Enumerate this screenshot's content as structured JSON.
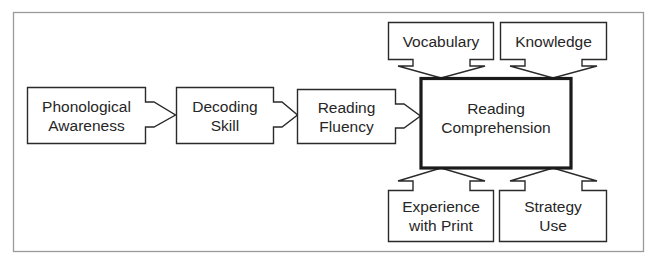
{
  "diagram": {
    "type": "flow-diagram",
    "colors": {
      "frame": "#9a9a9a",
      "stroke": "#2a2a2a",
      "text": "#262626",
      "background": "#ffffff"
    },
    "nodes": [
      {
        "id": "phonological",
        "lines": [
          "Phonological",
          "Awareness"
        ]
      },
      {
        "id": "decoding",
        "lines": [
          "Decoding",
          "Skill"
        ]
      },
      {
        "id": "fluency",
        "lines": [
          "Reading",
          "Fluency"
        ]
      },
      {
        "id": "comprehension",
        "lines": [
          "Reading",
          "Comprehension"
        ]
      },
      {
        "id": "vocabulary",
        "lines": [
          "Vocabulary"
        ]
      },
      {
        "id": "knowledge",
        "lines": [
          "Knowledge"
        ]
      },
      {
        "id": "experience",
        "lines": [
          "Experience",
          "with Print"
        ]
      },
      {
        "id": "strategy",
        "lines": [
          "Strategy",
          "Use"
        ]
      }
    ],
    "edges": [
      {
        "from": "Phonological Awareness",
        "to": "Decoding Skill"
      },
      {
        "from": "Decoding Skill",
        "to": "Reading Fluency"
      },
      {
        "from": "Reading Fluency",
        "to": "Reading Comprehension"
      },
      {
        "from": "Vocabulary",
        "to": "Reading Comprehension"
      },
      {
        "from": "Knowledge",
        "to": "Reading Comprehension"
      },
      {
        "from": "Experience with Print",
        "to": "Reading Comprehension"
      },
      {
        "from": "Strategy Use",
        "to": "Reading Comprehension"
      }
    ]
  }
}
